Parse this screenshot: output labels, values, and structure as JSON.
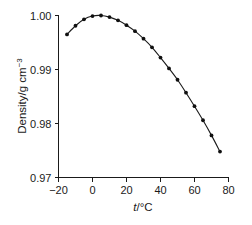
{
  "chart_data": {
    "type": "line",
    "title": "",
    "subtitle": "",
    "xlabel": "t/°C",
    "xlabel_var": "t",
    "xlabel_rest": "/°C",
    "ylabel": "Density/g cm⁻³",
    "ylabel_main": "Density/g cm",
    "ylabel_sup": "−3",
    "xlim": [
      -20,
      80
    ],
    "ylim": [
      0.97,
      1.0
    ],
    "xticks": [
      -20,
      0,
      20,
      40,
      60,
      80
    ],
    "xtick_labels": [
      "−20",
      "0",
      "20",
      "40",
      "60",
      "80"
    ],
    "yticks": [
      0.97,
      0.98,
      0.99,
      1.0
    ],
    "ytick_labels": [
      "0.97",
      "0.98",
      "0.99",
      "1.00"
    ],
    "grid": false,
    "legend": null,
    "marker": "filled-circle",
    "line_color": "#1a1a1a",
    "marker_color": "#101010",
    "x": [
      -15,
      -10,
      -5,
      0,
      5,
      10,
      15,
      20,
      25,
      30,
      35,
      40,
      45,
      50,
      55,
      60,
      65,
      70,
      75
    ],
    "y": [
      0.9965,
      0.9981,
      0.9993,
      0.9999,
      1.0,
      0.9997,
      0.9991,
      0.9982,
      0.9971,
      0.9957,
      0.9941,
      0.9922,
      0.9902,
      0.9881,
      0.9857,
      0.9832,
      0.9806,
      0.9778,
      0.9748
    ],
    "series": [
      {
        "name": "Density of water",
        "x": [
          -15,
          -10,
          -5,
          0,
          5,
          10,
          15,
          20,
          25,
          30,
          35,
          40,
          45,
          50,
          55,
          60,
          65,
          70,
          75
        ],
        "values": [
          0.9965,
          0.9981,
          0.9993,
          0.9999,
          1.0,
          0.9997,
          0.9991,
          0.9982,
          0.9971,
          0.9957,
          0.9941,
          0.9922,
          0.9902,
          0.9881,
          0.9857,
          0.9832,
          0.9806,
          0.9778,
          0.9748
        ]
      }
    ],
    "annotations": []
  }
}
